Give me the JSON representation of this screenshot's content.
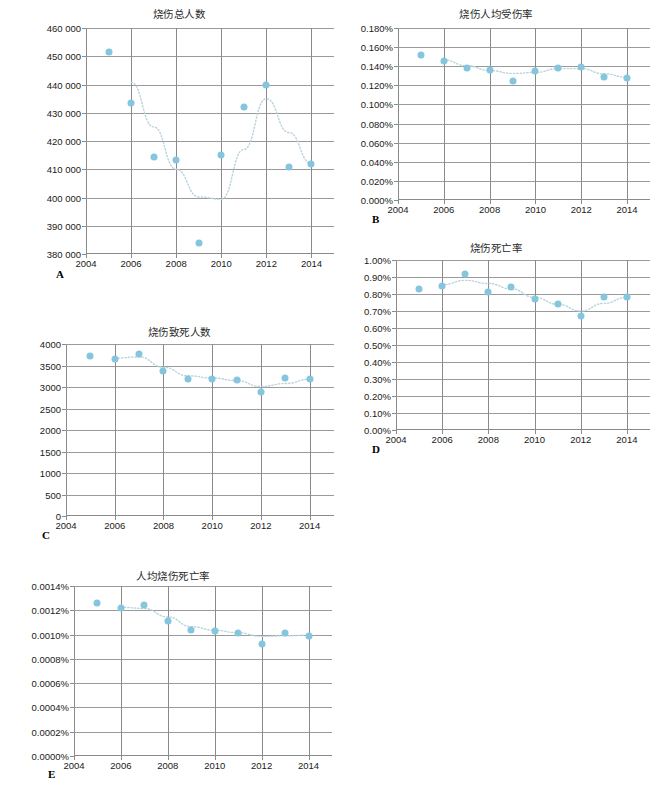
{
  "figure": {
    "caption": "",
    "marker_color": "#85c5dd",
    "trend_color": "#b9d4dd",
    "grid_color": "#9a9a9a",
    "axis_color": "#8a8a8a"
  },
  "panels": [
    {
      "letter": "A",
      "title": "烧伤总人数",
      "xticks": [
        "2004",
        "2006",
        "2008",
        "2010",
        "2012",
        "2014"
      ],
      "yticks": [
        "380 000",
        "390 000",
        "400 000",
        "410 000",
        "420 000",
        "430 000",
        "440 000",
        "450 000",
        "460 000"
      ]
    },
    {
      "letter": "B",
      "title": "烧伤人均受伤率",
      "xticks": [
        "2004",
        "2006",
        "2008",
        "2010",
        "2012",
        "2014"
      ],
      "yticks": [
        "0.000%",
        "0.020%",
        "0.040%",
        "0.060%",
        "0.080%",
        "0.100%",
        "0.120%",
        "0.140%",
        "0.160%",
        "0.180%"
      ]
    },
    {
      "letter": "C",
      "title": "烧伤致死人数",
      "xticks": [
        "2004",
        "2006",
        "2008",
        "2010",
        "2012",
        "2014"
      ],
      "yticks": [
        "0",
        "500",
        "1000",
        "1500",
        "2000",
        "2500",
        "3000",
        "3500",
        "4000"
      ]
    },
    {
      "letter": "D",
      "title": "烧伤死亡率",
      "xticks": [
        "2004",
        "2006",
        "2008",
        "2010",
        "2012",
        "2014"
      ],
      "yticks": [
        "0.00%",
        "0.10%",
        "0.20%",
        "0.30%",
        "0.40%",
        "0.50%",
        "0.60%",
        "0.70%",
        "0.80%",
        "0.90%",
        "1.00%"
      ]
    },
    {
      "letter": "E",
      "title": "人均烧伤死亡率",
      "xticks": [
        "2004",
        "2006",
        "2008",
        "2010",
        "2012",
        "2014"
      ],
      "yticks": [
        "0.0000%",
        "0.0002%",
        "0.0004%",
        "0.0006%",
        "0.0008%",
        "0.0010%",
        "0.0012%",
        "0.0014%"
      ]
    }
  ],
  "chart_data": [
    {
      "id": "A",
      "type": "scatter",
      "title": "烧伤总人数",
      "xlabel": "",
      "ylabel": "",
      "x": [
        2005,
        2006,
        2007,
        2008,
        2009,
        2010,
        2011,
        2012,
        2013,
        2014
      ],
      "values": [
        451500,
        433400,
        414400,
        413400,
        384000,
        415200,
        432100,
        439800,
        410700,
        411900
      ],
      "xlim": [
        2004,
        2015
      ],
      "ylim": [
        380000,
        460000
      ],
      "xticks": [
        2004,
        2006,
        2008,
        2010,
        2012,
        2014
      ],
      "yticks": [
        380000,
        390000,
        400000,
        410000,
        420000,
        430000,
        440000,
        450000,
        460000
      ],
      "grid": true,
      "legend": false,
      "trendline": {
        "type": "polynomial",
        "points": [
          [
            2006,
            440800
          ],
          [
            2007,
            425000
          ],
          [
            2008,
            410000
          ],
          [
            2009,
            400200
          ],
          [
            2010,
            399400
          ],
          [
            2011,
            417000
          ],
          [
            2012,
            435000
          ],
          [
            2013,
            423000
          ],
          [
            2014,
            412000
          ]
        ]
      }
    },
    {
      "id": "B",
      "type": "scatter",
      "title": "烧伤人均受伤率",
      "xlabel": "",
      "ylabel": "",
      "x": [
        2005,
        2006,
        2007,
        2008,
        2009,
        2010,
        2011,
        2012,
        2013,
        2014
      ],
      "values": [
        0.00152,
        0.00145,
        0.00138,
        0.00136,
        0.00125,
        0.00135,
        0.00138,
        0.00139,
        0.00129,
        0.00128
      ],
      "xlim": [
        2004,
        2015
      ],
      "ylim": [
        0,
        0.0018
      ],
      "xticks": [
        2004,
        2006,
        2008,
        2010,
        2012,
        2014
      ],
      "yticks": [
        0,
        0.0002,
        0.0004,
        0.0006,
        0.0008,
        0.001,
        0.0012,
        0.0014,
        0.0016,
        0.0018
      ],
      "grid": true,
      "legend": false,
      "trendline": {
        "type": "polynomial",
        "points": [
          [
            2006,
            0.001465
          ],
          [
            2007,
            0.001405
          ],
          [
            2008,
            0.001355
          ],
          [
            2009,
            0.001325
          ],
          [
            2010,
            0.001335
          ],
          [
            2011,
            0.001375
          ],
          [
            2012,
            0.001375
          ],
          [
            2013,
            0.00132
          ],
          [
            2014,
            0.001285
          ]
        ]
      }
    },
    {
      "id": "C",
      "type": "scatter",
      "title": "烧伤致死人数",
      "xlabel": "",
      "ylabel": "",
      "x": [
        2005,
        2006,
        2007,
        2008,
        2009,
        2010,
        2011,
        2012,
        2013,
        2014
      ],
      "values": [
        3720,
        3660,
        3770,
        3370,
        3190,
        3180,
        3160,
        2890,
        3210,
        3180
      ],
      "xlim": [
        2004,
        2015
      ],
      "ylim": [
        0,
        4000
      ],
      "xticks": [
        2004,
        2006,
        2008,
        2010,
        2012,
        2014
      ],
      "yticks": [
        0,
        500,
        1000,
        1500,
        2000,
        2500,
        3000,
        3500,
        4000
      ],
      "grid": true,
      "legend": false,
      "trendline": {
        "type": "polynomial",
        "points": [
          [
            2006,
            3670
          ],
          [
            2007,
            3700
          ],
          [
            2008,
            3460
          ],
          [
            2009,
            3260
          ],
          [
            2010,
            3210
          ],
          [
            2011,
            3150
          ],
          [
            2012,
            3010
          ],
          [
            2013,
            3080
          ],
          [
            2014,
            3180
          ]
        ]
      }
    },
    {
      "id": "D",
      "type": "scatter",
      "title": "烧伤死亡率",
      "xlabel": "",
      "ylabel": "",
      "x": [
        2005,
        2006,
        2007,
        2008,
        2009,
        2010,
        2011,
        2012,
        2013,
        2014
      ],
      "values": [
        0.0083,
        0.0085,
        0.0092,
        0.0081,
        0.0084,
        0.0077,
        0.0074,
        0.0067,
        0.0078,
        0.0078
      ],
      "xlim": [
        2004,
        2015
      ],
      "ylim": [
        0,
        0.01
      ],
      "xticks": [
        2004,
        2006,
        2008,
        2010,
        2012,
        2014
      ],
      "yticks": [
        0,
        0.001,
        0.002,
        0.003,
        0.004,
        0.005,
        0.006,
        0.007,
        0.008,
        0.009,
        0.01
      ],
      "grid": true,
      "legend": false,
      "trendline": {
        "type": "polynomial",
        "points": [
          [
            2006,
            0.00855
          ],
          [
            2007,
            0.0088
          ],
          [
            2008,
            0.00862
          ],
          [
            2009,
            0.0083
          ],
          [
            2010,
            0.0078
          ],
          [
            2011,
            0.0074
          ],
          [
            2012,
            0.007
          ],
          [
            2013,
            0.00745
          ],
          [
            2014,
            0.0078
          ]
        ]
      }
    },
    {
      "id": "E",
      "type": "scatter",
      "title": "人均烧伤死亡率",
      "xlabel": "",
      "ylabel": "",
      "x": [
        2005,
        2006,
        2007,
        2008,
        2009,
        2010,
        2011,
        2012,
        2013,
        2014
      ],
      "values": [
        1.26e-05,
        1.22e-05,
        1.24e-05,
        1.11e-05,
        1.04e-05,
        1.03e-05,
        1.01e-05,
        9.2e-06,
        1.01e-05,
        9.9e-06
      ],
      "xlim": [
        2004,
        2015
      ],
      "ylim": [
        0,
        1.4e-05
      ],
      "xticks": [
        2004,
        2006,
        2008,
        2010,
        2012,
        2014
      ],
      "yticks": [
        0,
        2e-06,
        4e-06,
        6e-06,
        8e-06,
        1e-05,
        1.2e-05,
        1.4e-05
      ],
      "grid": true,
      "legend": false,
      "trendline": {
        "type": "polynomial",
        "points": [
          [
            2006,
            1.225e-05
          ],
          [
            2007,
            1.215e-05
          ],
          [
            2008,
            1.145e-05
          ],
          [
            2009,
            1.065e-05
          ],
          [
            2010,
            1.035e-05
          ],
          [
            2011,
            1.015e-05
          ],
          [
            2012,
            9.85e-06
          ],
          [
            2013,
            9.9e-06
          ],
          [
            2014,
            9.95e-06
          ]
        ]
      }
    }
  ]
}
